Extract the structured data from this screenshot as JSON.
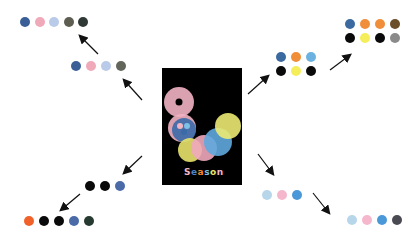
{
  "poster": {
    "background": "#000000",
    "title_letters": [
      "S",
      "e",
      "a",
      "s",
      "o",
      "n"
    ],
    "title_colors": [
      "#f2b6c6",
      "#4d86c9",
      "#f28a2e",
      "#7ec0e6",
      "#e9e56a",
      "#f2b6c6"
    ],
    "circles": [
      {
        "cx": 17,
        "cy": 34,
        "r": 15,
        "color": "#f2b3c3",
        "hole": true
      },
      {
        "cx": 20,
        "cy": 60,
        "r": 14,
        "color": "#f2b3c3"
      },
      {
        "cx": 22,
        "cy": 62,
        "r": 12,
        "color": "#3b6aa8"
      },
      {
        "cx": 28,
        "cy": 82,
        "r": 12,
        "color": "#e8e36a"
      },
      {
        "cx": 42,
        "cy": 80,
        "r": 13,
        "color": "#f0a9bd"
      },
      {
        "cx": 56,
        "cy": 74,
        "r": 14,
        "color": "#5fa9de"
      },
      {
        "cx": 66,
        "cy": 58,
        "r": 13,
        "color": "#ecea72"
      }
    ]
  },
  "palettes": {
    "upper_left_outer": [
      "#3a5f96",
      "#f0a9b9",
      "#b9cbe8",
      "#5d5d52",
      "#2f3a36"
    ],
    "upper_left_inner": [
      "#3a5f96",
      "#f0a9b9",
      "#b9cbe8",
      "#62665a"
    ],
    "upper_right_inner_row1": [
      "#3b6aa0",
      "#f08e3a",
      "#6cb2e0"
    ],
    "upper_right_inner_row2": [
      "#0a0a0a",
      "#f5ee5a",
      "#0a0a0a"
    ],
    "upper_right_outer_row1": [
      "#3b6aa0",
      "#f08e3a",
      "#f08e3a",
      "#6b4e2a"
    ],
    "upper_right_outer_row2": [
      "#0a0a0a",
      "#f5ee5a",
      "#0a0a0a",
      "#8a8a8a"
    ],
    "lower_left_inner": [
      "#0a0a0a",
      "#0a0a0a",
      "#4a6aa8"
    ],
    "lower_left_outer": [
      "#f0622a",
      "#0a0a0a",
      "#0a0a0a",
      "#4a6aa8",
      "#263a32"
    ],
    "lower_right_inner": [
      "#b8d6ea",
      "#f5b7cb",
      "#4b98d8"
    ],
    "lower_right_outer": [
      "#b8d6ea",
      "#f5b7cb",
      "#4b98d8",
      "#4a4a52"
    ]
  }
}
